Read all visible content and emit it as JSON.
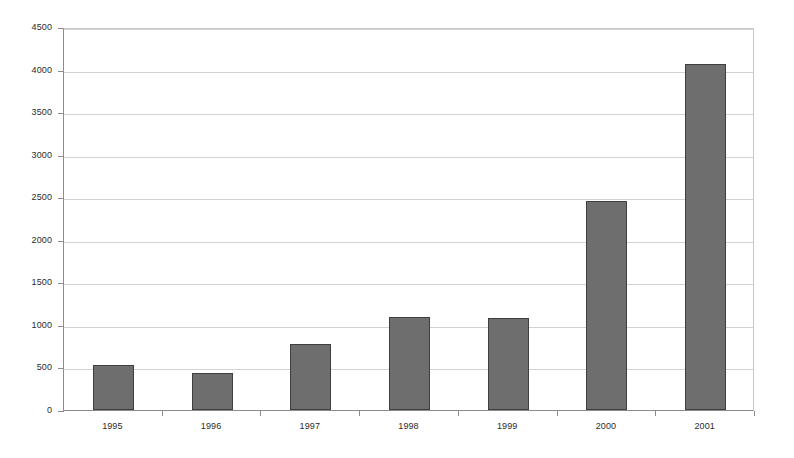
{
  "chart_data": {
    "type": "bar",
    "title": "",
    "subtitle": "",
    "xlabel": "",
    "ylabel": "",
    "categories": [
      "1995",
      "1996",
      "1997",
      "1998",
      "1999",
      "2000",
      "2001"
    ],
    "values": [
      530,
      430,
      780,
      1090,
      1080,
      2450,
      4060
    ],
    "series": [
      {
        "name": "",
        "values": [
          530,
          430,
          780,
          1090,
          1080,
          2450,
          4060
        ]
      }
    ],
    "ylim": [
      0,
      4500
    ],
    "yticks": [
      0,
      500,
      1000,
      1500,
      2000,
      2500,
      3000,
      3500,
      4000,
      4500
    ],
    "ytick_labels": [
      "0",
      "500",
      "1000",
      "1500",
      "2000",
      "2500",
      "3000",
      "3500",
      "4000",
      "4500"
    ],
    "grid": true,
    "grid_axis": "y",
    "legend": false,
    "legend_position": "none",
    "bar_color": "#6e6e6e",
    "bar_border_color": "#3f3f3f",
    "grid_color": "#d2d2d2",
    "axis_color": "#8c8c8c",
    "background_color": "#ffffff",
    "annotations": []
  }
}
